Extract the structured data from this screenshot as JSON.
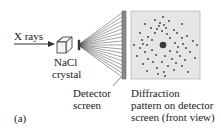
{
  "labels": {
    "xrays": "X rays",
    "crystal_line1": "NaCl",
    "crystal_line2": "crystal",
    "detector_line1": "Detector",
    "detector_line2": "screen",
    "pattern_line1": "Diffraction",
    "pattern_line2": "pattern on detector",
    "pattern_line3": "screen (front view)",
    "panel": "(a)"
  },
  "colors": {
    "detector_bar": "#8a8a8a",
    "pattern_bg": "#e6e6e6",
    "spot": "#3a3a3a",
    "line": "#333333"
  }
}
